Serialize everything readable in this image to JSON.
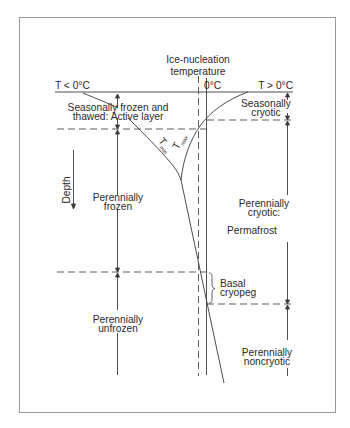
{
  "diagram": {
    "title": "Ice-nucleation temperature",
    "title_line1": "Ice-nucleation",
    "title_line2": "temperature",
    "axis": {
      "left_label": "T < 0°C",
      "zero_label": "0°C",
      "right_label": "T > 0°C",
      "depth_label": "Depth"
    },
    "curves": {
      "tmin_label": "T",
      "tmin_sub": "min",
      "tmax_label": "T",
      "tmax_sub": "max"
    },
    "left_zones": {
      "active_layer_line1": "Seasonally frozen and",
      "active_layer_line2": "thawed: Active layer",
      "perennially_frozen_line1": "Perennially",
      "perennially_frozen_line2": "frozen",
      "perennially_unfrozen_line1": "Perennially",
      "perennially_unfrozen_line2": "unfrozen"
    },
    "right_zones": {
      "seasonally_cryotic_line1": "Seasonally",
      "seasonally_cryotic_line2": "cryotic",
      "perennially_cryotic_line1": "Perennially",
      "perennially_cryotic_line2": "cryotic:",
      "permafrost": "Permafrost",
      "basal_cryopeg_line1": "Basal",
      "basal_cryopeg_line2": "cryopeg",
      "perennially_noncryotic_line1": "Perennially",
      "perennially_noncryotic_line2": "noncryotic"
    },
    "colors": {
      "line": "#3a3a3a",
      "frame": "#9a9a9a",
      "text": "#2a2a2a",
      "background": "#ffffff"
    }
  }
}
